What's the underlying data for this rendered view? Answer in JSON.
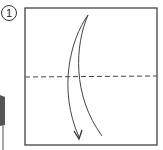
{
  "diagram": {
    "type": "origami-instruction",
    "step": {
      "number": "1"
    },
    "paper": {
      "shape": "square",
      "stroke": "#444444"
    },
    "fold_line": {
      "style": "dashed",
      "orientation": "horizontal",
      "position": "middle"
    },
    "arrow": {
      "direction": "top-to-bottom",
      "meaning": "fold top edge down to bottom"
    },
    "partial_previous_figure": {
      "visible": true,
      "position": "left edge, cropped"
    }
  }
}
